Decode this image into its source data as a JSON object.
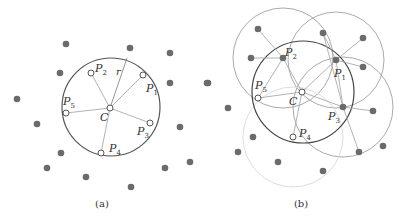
{
  "panels": [
    {
      "caption": "(a)",
      "caption_pos": [
        102,
        207
      ],
      "main_circle": {
        "cx": 111,
        "cy": 107,
        "r": 49,
        "color": "#555555"
      },
      "center": {
        "label": "C",
        "x": 110,
        "y": 108,
        "label_x": 100,
        "label_y": 121
      },
      "radius_label": {
        "text": "r",
        "x": 116,
        "y": 75
      },
      "radius_end": [
        127,
        58
      ],
      "open_points": [
        {
          "label": "P",
          "sub": "1",
          "x": 143,
          "y": 75,
          "lx": 146,
          "ly": 92
        },
        {
          "label": "P",
          "sub": "2",
          "x": 91,
          "y": 73,
          "lx": 95,
          "ly": 72
        },
        {
          "label": "P",
          "sub": "3",
          "x": 150,
          "y": 123,
          "lx": 137,
          "ly": 135
        },
        {
          "label": "P",
          "sub": "4",
          "x": 101,
          "y": 153,
          "lx": 109,
          "ly": 152
        },
        {
          "label": "P",
          "sub": "5",
          "x": 66,
          "y": 113,
          "lx": 63,
          "ly": 105
        }
      ],
      "filled_points": [
        [
          66,
          44
        ],
        [
          130,
          48
        ],
        [
          170,
          53
        ],
        [
          60,
          73
        ],
        [
          170,
          83
        ],
        [
          208,
          83
        ],
        [
          17,
          99
        ],
        [
          37,
          124
        ],
        [
          180,
          127
        ],
        [
          61,
          153
        ],
        [
          190,
          162
        ],
        [
          47,
          168
        ],
        [
          165,
          168
        ],
        [
          86,
          177
        ],
        [
          131,
          187
        ]
      ]
    },
    {
      "caption": "(b)",
      "caption_pos": [
        301,
        207
      ],
      "main_circle": {
        "cx": 303,
        "cy": 92,
        "r": 51,
        "color": "#444444"
      },
      "center": {
        "label": "C",
        "x": 302,
        "y": 92,
        "label_x": 289,
        "label_y": 105
      },
      "neighbor_circles": [
        {
          "cx": 283,
          "cy": 58,
          "r": 50,
          "color": "#aaaaaa"
        },
        {
          "cx": 336,
          "cy": 60,
          "r": 48,
          "color": "#aaaaaa"
        },
        {
          "cx": 343,
          "cy": 107,
          "r": 50,
          "color": "#aaaaaa"
        },
        {
          "cx": 293,
          "cy": 137,
          "r": 50,
          "color": "#dddddd"
        }
      ],
      "filled_members": [
        {
          "label": "P",
          "sub": "1",
          "x": 336,
          "y": 60,
          "lx": 334,
          "ly": 77
        },
        {
          "label": "P",
          "sub": "2",
          "x": 283,
          "y": 58,
          "lx": 285,
          "ly": 56
        },
        {
          "label": "P",
          "sub": "3",
          "x": 343,
          "y": 107,
          "lx": 328,
          "ly": 120
        }
      ],
      "open_points": [
        {
          "label": "P",
          "sub": "4",
          "x": 293,
          "y": 137,
          "lx": 299,
          "ly": 137
        },
        {
          "label": "P",
          "sub": "5",
          "x": 258,
          "y": 98,
          "lx": 255,
          "ly": 89
        }
      ],
      "filled_points": [
        [
          258,
          29
        ],
        [
          323,
          33
        ],
        [
          363,
          38
        ],
        [
          251,
          58
        ],
        [
          363,
          67
        ],
        [
          207,
          83
        ],
        [
          228,
          108
        ],
        [
          373,
          111
        ],
        [
          253,
          137
        ],
        [
          383,
          146
        ],
        [
          238,
          152
        ],
        [
          359,
          152
        ],
        [
          278,
          162
        ],
        [
          323,
          171
        ]
      ],
      "edges": [
        [
          283,
          58,
          258,
          29
        ],
        [
          283,
          58,
          251,
          58
        ],
        [
          283,
          58,
          258,
          98
        ],
        [
          283,
          58,
          302,
          92
        ],
        [
          336,
          60,
          323,
          33
        ],
        [
          336,
          60,
          363,
          38
        ],
        [
          336,
          60,
          363,
          67
        ],
        [
          336,
          60,
          343,
          107
        ],
        [
          336,
          60,
          302,
          92
        ],
        [
          323,
          33,
          343,
          107
        ],
        [
          343,
          107,
          302,
          92
        ],
        [
          343,
          107,
          373,
          111
        ],
        [
          343,
          107,
          359,
          152
        ],
        [
          302,
          92,
          258,
          98
        ],
        [
          302,
          92,
          293,
          137
        ]
      ]
    }
  ],
  "colors": {
    "filled_dot": "#6b6b6b",
    "open_dot_stroke": "#555555",
    "spoke": "#aaaaaa",
    "text": "#333333"
  }
}
